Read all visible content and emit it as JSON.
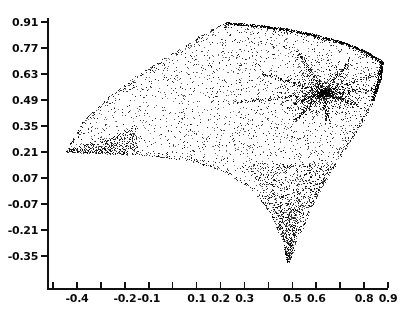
{
  "chart_data": {
    "type": "scatter",
    "title": "",
    "xlabel": "",
    "ylabel": "",
    "xlim": [
      -0.5,
      0.9
    ],
    "ylim": [
      -0.44,
      0.95
    ],
    "grid": false,
    "legend": null,
    "marker": {
      "style": "dot",
      "color": "#000000",
      "size": 1
    },
    "point_count_approx": 4200,
    "x_ticks": [
      -0.5,
      -0.4,
      -0.3,
      -0.2,
      -0.1,
      0.0,
      0.1,
      0.2,
      0.3,
      0.4,
      0.5,
      0.6,
      0.7,
      0.8,
      0.9
    ],
    "x_tick_labels": [
      "",
      "-0.4",
      "",
      "-0.2",
      "-0.1",
      "",
      "0.1",
      "0.2",
      "0.3",
      "",
      "0.5",
      "0.6",
      "",
      "0.8",
      "0.9"
    ],
    "y_ticks": [
      0.91,
      0.77,
      0.63,
      0.49,
      0.35,
      0.21,
      0.07,
      -0.07,
      -0.21,
      -0.35
    ],
    "y_tick_labels": [
      "0.91",
      "0.77",
      "0.63",
      "0.49",
      "0.35",
      "0.21",
      "0.07",
      "-0.07",
      "-0.21",
      "-0.35"
    ],
    "features": {
      "left_cusp": {
        "x": -0.45,
        "y": 0.21
      },
      "top_peak": {
        "x": 0.22,
        "y": 0.91
      },
      "right_vertex": {
        "x": 0.88,
        "y": 0.7
      },
      "bottom_spike_tip": {
        "x": 0.48,
        "y": -0.4
      },
      "dense_knot": {
        "x": 0.63,
        "y": 0.53
      }
    },
    "boundary_points": [
      [
        -0.45,
        0.21
      ],
      [
        -0.37,
        0.39
      ],
      [
        -0.26,
        0.52
      ],
      [
        -0.12,
        0.65
      ],
      [
        0.02,
        0.76
      ],
      [
        0.14,
        0.86
      ],
      [
        0.22,
        0.91
      ],
      [
        0.34,
        0.9
      ],
      [
        0.46,
        0.88
      ],
      [
        0.58,
        0.85
      ],
      [
        0.7,
        0.81
      ],
      [
        0.8,
        0.76
      ],
      [
        0.88,
        0.7
      ],
      [
        0.87,
        0.6
      ],
      [
        0.84,
        0.49
      ],
      [
        0.79,
        0.36
      ],
      [
        0.72,
        0.22
      ],
      [
        0.65,
        0.08
      ],
      [
        0.58,
        -0.09
      ],
      [
        0.53,
        -0.24
      ],
      [
        0.49,
        -0.37
      ],
      [
        0.48,
        -0.4
      ],
      [
        0.46,
        -0.28
      ],
      [
        0.41,
        -0.13
      ],
      [
        0.33,
        0.01
      ],
      [
        0.22,
        0.1
      ],
      [
        0.08,
        0.16
      ],
      [
        -0.1,
        0.19
      ],
      [
        -0.28,
        0.2
      ],
      [
        -0.45,
        0.21
      ]
    ]
  }
}
